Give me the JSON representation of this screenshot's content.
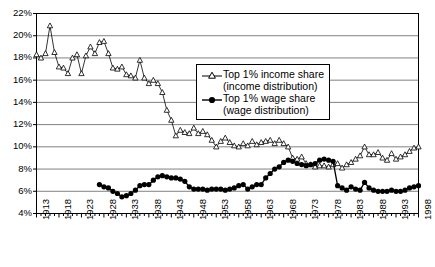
{
  "chart_data": {
    "type": "line",
    "title": "",
    "xlabel": "",
    "ylabel": "",
    "xlim": [
      1913,
      1998
    ],
    "ylim": [
      4,
      22
    ],
    "ytick_step": 2,
    "yticks": [
      "4%",
      "6%",
      "8%",
      "10%",
      "12%",
      "14%",
      "16%",
      "18%",
      "20%",
      "22%"
    ],
    "xticks": [
      "1913",
      "1918",
      "1923",
      "1928",
      "1933",
      "1938",
      "1943",
      "1948",
      "1953",
      "1958",
      "1963",
      "1968",
      "1973",
      "1978",
      "1983",
      "1988",
      "1993",
      "1998"
    ],
    "xtick_step": 5,
    "grid": "horizontal",
    "legend_position": "upper-center-right",
    "colors": {
      "line": "#000000",
      "grid": "#808080",
      "axis": "#000000",
      "background": "#ffffff"
    },
    "series": [
      {
        "name": "Top 1% income share (income distribution)",
        "marker": "open-triangle",
        "x": [
          1913,
          1914,
          1915,
          1916,
          1917,
          1918,
          1919,
          1920,
          1921,
          1922,
          1923,
          1924,
          1925,
          1926,
          1927,
          1928,
          1929,
          1930,
          1931,
          1932,
          1933,
          1934,
          1935,
          1936,
          1937,
          1938,
          1939,
          1940,
          1941,
          1942,
          1943,
          1944,
          1945,
          1946,
          1947,
          1948,
          1949,
          1950,
          1951,
          1952,
          1953,
          1954,
          1955,
          1956,
          1957,
          1958,
          1959,
          1960,
          1961,
          1962,
          1963,
          1964,
          1965,
          1966,
          1967,
          1968,
          1969,
          1970,
          1971,
          1972,
          1973,
          1974,
          1975,
          1976,
          1977,
          1978,
          1979,
          1980,
          1981,
          1982,
          1983,
          1984,
          1985,
          1986,
          1987,
          1988,
          1989,
          1990,
          1991,
          1992,
          1993,
          1994,
          1995,
          1996,
          1997,
          1998
        ],
        "values": [
          18.3,
          18.0,
          18.4,
          20.9,
          18.5,
          17.2,
          17.1,
          16.6,
          18.0,
          18.3,
          16.6,
          18.2,
          19.0,
          18.4,
          19.4,
          19.5,
          18.4,
          17.1,
          17.0,
          17.2,
          16.5,
          16.4,
          16.2,
          17.8,
          16.2,
          15.7,
          16.0,
          15.7,
          14.9,
          13.3,
          12.4,
          11.0,
          11.5,
          11.3,
          11.2,
          11.7,
          11.2,
          11.4,
          11.1,
          10.6,
          10.0,
          10.5,
          10.8,
          10.4,
          10.1,
          10.0,
          10.3,
          10.1,
          10.5,
          10.2,
          10.4,
          10.5,
          10.6,
          10.3,
          10.6,
          10.3,
          10.0,
          9.0,
          8.9,
          9.1,
          8.5,
          8.4,
          8.2,
          8.3,
          8.3,
          8.2,
          8.4,
          8.5,
          8.1,
          8.4,
          8.6,
          8.9,
          9.2,
          10.0,
          9.3,
          9.3,
          9.5,
          9.0,
          8.8,
          9.4,
          8.9,
          9.1,
          9.3,
          9.6,
          9.9,
          10.0
        ]
      },
      {
        "name": "Top 1% wage share (wage distribution)",
        "marker": "filled-circle",
        "x": [
          1927,
          1928,
          1929,
          1930,
          1931,
          1932,
          1933,
          1934,
          1935,
          1936,
          1937,
          1938,
          1939,
          1940,
          1941,
          1942,
          1943,
          1944,
          1945,
          1946,
          1947,
          1948,
          1949,
          1950,
          1951,
          1952,
          1953,
          1954,
          1955,
          1956,
          1957,
          1958,
          1959,
          1960,
          1961,
          1962,
          1963,
          1964,
          1965,
          1966,
          1967,
          1968,
          1969,
          1970,
          1971,
          1972,
          1973,
          1974,
          1975,
          1976,
          1977,
          1978,
          1979,
          1980,
          1981,
          1982,
          1983,
          1984,
          1985,
          1986,
          1987,
          1988,
          1989,
          1990,
          1991,
          1992,
          1993,
          1994,
          1995,
          1996,
          1997,
          1998
        ],
        "values": [
          6.6,
          6.4,
          6.3,
          6.0,
          5.8,
          5.5,
          5.6,
          5.8,
          6.1,
          6.5,
          6.6,
          6.6,
          7.0,
          7.3,
          7.4,
          7.3,
          7.2,
          7.2,
          7.1,
          6.9,
          6.4,
          6.2,
          6.2,
          6.2,
          6.1,
          6.2,
          6.2,
          6.2,
          6.1,
          6.2,
          6.3,
          6.5,
          6.6,
          6.2,
          6.4,
          6.6,
          6.6,
          7.2,
          7.6,
          8.0,
          8.2,
          8.6,
          8.8,
          8.7,
          8.5,
          8.4,
          8.3,
          8.4,
          8.5,
          8.8,
          8.9,
          8.8,
          8.7,
          6.5,
          6.3,
          6.1,
          6.4,
          6.2,
          6.1,
          6.8,
          6.3,
          6.1,
          6.0,
          6.0,
          6.0,
          6.1,
          6.0,
          6.0,
          6.1,
          6.3,
          6.4,
          6.5
        ]
      }
    ]
  },
  "legend": {
    "entries": [
      {
        "label_line1": "Top 1% income share",
        "label_line2": "(income distribution)",
        "marker": "open-triangle"
      },
      {
        "label_line1": "Top 1% wage share",
        "label_line2": "(wage distribution)",
        "marker": "filled-circle"
      }
    ]
  }
}
